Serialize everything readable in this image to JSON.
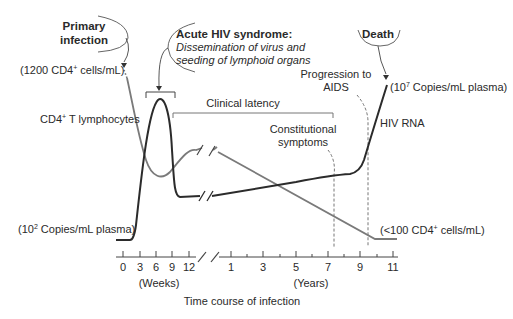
{
  "callouts": {
    "primary_infection": {
      "line1": "Primary",
      "line2": "infection"
    },
    "acute_syndrome": {
      "title": "Acute HIV syndrome:",
      "line1": "Dissemination of virus and",
      "line2": "seeding of lymphoid organs"
    },
    "death": "Death"
  },
  "labels": {
    "cd4_start_pre": "(1200 CD4",
    "cd4_start_sup": "+",
    "cd4_start_post": " cells/mL)",
    "cd4_curve_pre": "CD4",
    "cd4_curve_sup": "+",
    "cd4_curve_post": " T lymphocytes",
    "rna_low_pre": "(10",
    "rna_low_sup": "2",
    "rna_low_post": " Copies/mL plasma)",
    "rna_high_pre": "(10",
    "rna_high_sup": "7",
    "rna_high_post": " Copies/mL plasma)",
    "cd4_end_pre": "(<100 CD4",
    "cd4_end_sup": "+",
    "cd4_end_post": " cells/mL)",
    "hiv_rna": "HIV RNA",
    "clinical_latency": "Clinical latency",
    "constitutional_1": "Constitutional",
    "constitutional_2": "symptoms",
    "progression_1": "Progression to",
    "progression_2": "AIDS"
  },
  "axis": {
    "weeks_ticks": [
      "0",
      "3",
      "6",
      "9",
      "12"
    ],
    "years_ticks": [
      "1",
      "3",
      "5",
      "7",
      "9",
      "11"
    ],
    "weeks_unit": "(Weeks)",
    "years_unit": "(Years)",
    "title": "Time course of infection"
  },
  "colors": {
    "hiv_rna": "#2b2b2b",
    "cd4": "#7a7a7a",
    "text": "#2a2a2a"
  }
}
